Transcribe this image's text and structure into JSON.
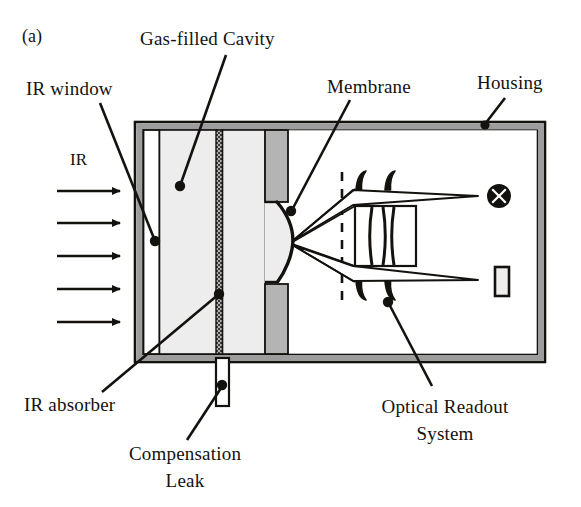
{
  "figure": {
    "panel_label": "(a)",
    "type": "cross-section schematic of an optical-readout infrared gas sensor"
  },
  "labels": {
    "gas_filled_cavity": "Gas-filled Cavity",
    "ir_window": "IR window",
    "membrane": "Membrane",
    "housing": "Housing",
    "ir_absorber": "IR absorber",
    "compensation_leak_line1": "Compensation",
    "compensation_leak_line2": "Leak",
    "optical_readout_line1": "Optical Readout",
    "optical_readout_line2": "System",
    "ir_beam": "IR"
  },
  "icons": {
    "light_source": "crossed-circle-lamp-icon",
    "detector": "photodetector-rectangle-icon",
    "ir_arrow": "right-arrow-icon",
    "leader_dot": "leader-endpoint-dot-icon"
  },
  "counts": {
    "ir_arrows": 5,
    "lens_elements": 3,
    "optical_rays": 4
  },
  "colors": {
    "ink": "#14120f",
    "housing_wall": "#9d9d9d",
    "cavity_fill": "#ededed",
    "membrane_support": "#b4b4b4",
    "absorber": "#2b2b2b",
    "page": "#ffffff"
  }
}
